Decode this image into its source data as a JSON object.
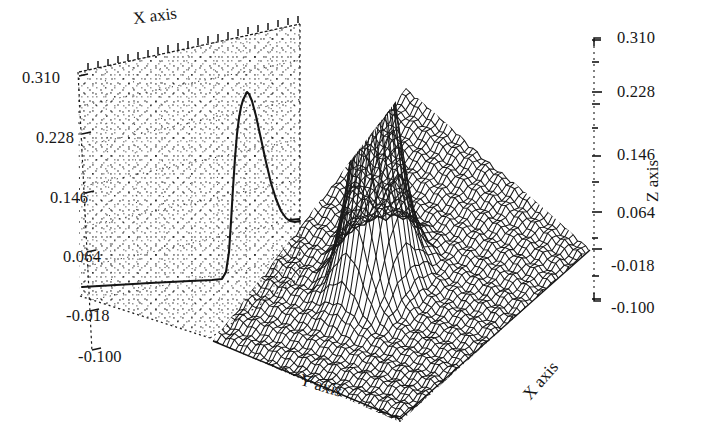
{
  "figure": {
    "background_color": "#ffffff",
    "ink_color": "#161616",
    "style": "dot-matrix wireframe mesh"
  },
  "axes": {
    "x_axis_top": {
      "label": "X axis"
    },
    "x_axis_bottom_right": {
      "label": "X axis"
    },
    "y_axis_bottom": {
      "label": "Y axis"
    },
    "z_axis_right": {
      "label": "Z axis"
    }
  },
  "left_ticks": [
    {
      "value": "0.310",
      "x": 22,
      "y": 68
    },
    {
      "value": "0.228",
      "x": 36,
      "y": 128
    },
    {
      "value": "0.146",
      "x": 50,
      "y": 188
    },
    {
      "value": "0.064",
      "x": 63,
      "y": 247
    },
    {
      "value": "-0.018",
      "x": 66,
      "y": 306
    },
    {
      "value": "-0.100",
      "x": 78,
      "y": 347
    }
  ],
  "right_ticks": [
    {
      "value": "0.310",
      "x": 617,
      "y": 28
    },
    {
      "value": "0.228",
      "x": 617,
      "y": 82
    },
    {
      "value": "0.146",
      "x": 617,
      "y": 145
    },
    {
      "value": "0.064",
      "x": 617,
      "y": 203
    },
    {
      "value": "-0.018",
      "x": 611,
      "y": 256
    },
    {
      "value": "-0.100",
      "x": 611,
      "y": 298
    }
  ],
  "chart_data": {
    "type": "surface",
    "title": "",
    "xlabel": "X axis",
    "ylabel": "Y axis",
    "zlabel": "Z axis",
    "grid": true,
    "legend": "none",
    "projection": "3d-mesh-with-backwall-profile",
    "zlim": [
      -0.1,
      0.31
    ],
    "z_ticks": [
      -0.1,
      -0.018,
      0.064,
      0.146,
      0.228,
      0.31
    ],
    "z_tick_labels": [
      "-0.100",
      "-0.018",
      "0.064",
      "0.146",
      "0.228",
      "0.310"
    ],
    "surface_function": "peak(x,y) = 0.31 * exp(-((x^2 + y^2) / (2 * 0.11^2))) - 0.018",
    "peak": {
      "z_max": 0.31,
      "x": 0.0,
      "y": 0.0
    },
    "baseline_z": -0.018,
    "grid_nx": 44,
    "grid_ny": 44,
    "x_range": [
      -1,
      1
    ],
    "y_range": [
      -1,
      1
    ],
    "backwall_profile": {
      "description": "projected X-profile curve on rear panel",
      "baseline": 0.03,
      "peak_value": 0.295
    }
  }
}
